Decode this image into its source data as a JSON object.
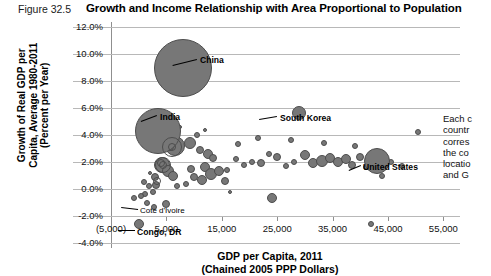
{
  "figure": {
    "number_label": "Figure 32.5",
    "title": "Growth and Income Relationship with Area Proportional to Population"
  },
  "axes": {
    "y_title_line1": "Growth of Real GDP per",
    "y_title_line2": "Capita, Average 1980-2011",
    "y_title_line3": "(Percent per Year)",
    "x_title_line1": "GDP per Capita, 2011",
    "x_title_line2": "(Chained 2005 PPP Dollars)",
    "y_ticks": [
      "12.0%",
      "10.0%",
      "8.0%",
      "6.0%",
      "4.0%",
      "2.0%",
      "0.0%",
      "-2.0%",
      "-4.0%"
    ],
    "x_ticks": [
      "(5,000)",
      "5,000",
      "15,000",
      "25,000",
      "35,000",
      "45,000",
      "55,000"
    ]
  },
  "side_note": {
    "line1": "Each c",
    "line2": "countr",
    "line3": "corres",
    "line4": "the co",
    "line5": "locatio",
    "line6": "and G"
  },
  "annotations": {
    "china": "China",
    "india": "India",
    "south_korea": "South Korea",
    "united_states": "United States",
    "cote_divoire": "Cote d'Ivoire",
    "congo_dr": "Congo, DR"
  },
  "colors": {
    "bubble_fill": "#777777",
    "bubble_stroke": "#4d4d4d",
    "grid": "#b8b8b8",
    "axis": "#8f8f8f",
    "text": "#000000"
  },
  "chart_data": {
    "type": "scatter",
    "title": "Growth and Income Relationship with Area Proportional to Population",
    "xlabel": "GDP per Capita, 2011 (Chained 2005 PPP Dollars)",
    "ylabel": "Growth of Real GDP per Capita, Average 1980-2011 (Percent per Year)",
    "xlim": [
      -5000,
      58000
    ],
    "ylim": [
      -4.0,
      12.0
    ],
    "xticks": [
      -5000,
      5000,
      15000,
      25000,
      35000,
      45000,
      55000
    ],
    "yticks": [
      -4.0,
      -2.0,
      0.0,
      2.0,
      4.0,
      6.0,
      8.0,
      10.0,
      12.0
    ],
    "grid": true,
    "legend": "none",
    "size_encoding": "bubble area proportional to population",
    "labeled_points": [
      {
        "name": "China",
        "x": 8000,
        "y": 9.0,
        "r": 29
      },
      {
        "name": "India",
        "x": 3500,
        "y": 4.3,
        "r": 23
      },
      {
        "name": "South Korea",
        "x": 29000,
        "y": 5.6,
        "r": 7
      },
      {
        "name": "United States",
        "x": 43000,
        "y": 2.1,
        "r": 13
      },
      {
        "name": "Cote d'Ivoire",
        "x": -800,
        "y": -0.7,
        "r": 3
      },
      {
        "name": "Congo, DR",
        "x": 0,
        "y": -2.6,
        "r": 5
      }
    ],
    "points": [
      {
        "x": 6500,
        "y": 3.2,
        "r": 10
      },
      {
        "x": 5600,
        "y": 3.1,
        "r": 4
      },
      {
        "x": 9200,
        "y": 3.4,
        "r": 6
      },
      {
        "x": 4200,
        "y": 1.8,
        "r": 8
      },
      {
        "x": 4100,
        "y": 1.9,
        "r": 4
      },
      {
        "x": 3000,
        "y": 0.9,
        "r": 4
      },
      {
        "x": 5300,
        "y": 1.3,
        "r": 6
      },
      {
        "x": 6200,
        "y": 1.0,
        "r": 5
      },
      {
        "x": 3100,
        "y": 0.3,
        "r": 4
      },
      {
        "x": 1800,
        "y": 0.2,
        "r": 3
      },
      {
        "x": 900,
        "y": 0.5,
        "r": 3
      },
      {
        "x": 2500,
        "y": -0.2,
        "r": 3
      },
      {
        "x": 1200,
        "y": -0.4,
        "r": 3
      },
      {
        "x": 400,
        "y": -0.5,
        "r": 3
      },
      {
        "x": 2000,
        "y": 1.2,
        "r": 2
      },
      {
        "x": 11000,
        "y": 2.9,
        "r": 4
      },
      {
        "x": 12500,
        "y": 2.6,
        "r": 5
      },
      {
        "x": 13500,
        "y": 2.3,
        "r": 4
      },
      {
        "x": 12000,
        "y": 1.6,
        "r": 5
      },
      {
        "x": 13000,
        "y": 1.1,
        "r": 6
      },
      {
        "x": 14500,
        "y": 1.3,
        "r": 5
      },
      {
        "x": 11500,
        "y": 0.7,
        "r": 5
      },
      {
        "x": 10000,
        "y": 0.9,
        "r": 4
      },
      {
        "x": 9500,
        "y": 1.5,
        "r": 4
      },
      {
        "x": 15500,
        "y": 0.6,
        "r": 4
      },
      {
        "x": 16000,
        "y": 1.4,
        "r": 3
      },
      {
        "x": 17500,
        "y": 2.2,
        "r": 3
      },
      {
        "x": 19000,
        "y": 1.8,
        "r": 3
      },
      {
        "x": 20500,
        "y": 2.0,
        "r": 3
      },
      {
        "x": 22000,
        "y": 1.9,
        "r": 4
      },
      {
        "x": 23500,
        "y": 2.6,
        "r": 3
      },
      {
        "x": 25000,
        "y": 2.4,
        "r": 4
      },
      {
        "x": 26500,
        "y": 1.7,
        "r": 3
      },
      {
        "x": 28000,
        "y": 2.0,
        "r": 3
      },
      {
        "x": 30000,
        "y": 2.5,
        "r": 5
      },
      {
        "x": 31500,
        "y": 1.9,
        "r": 5
      },
      {
        "x": 33000,
        "y": 2.1,
        "r": 6
      },
      {
        "x": 34500,
        "y": 2.3,
        "r": 5
      },
      {
        "x": 36000,
        "y": 2.0,
        "r": 5
      },
      {
        "x": 37500,
        "y": 2.2,
        "r": 5
      },
      {
        "x": 38500,
        "y": 1.8,
        "r": 4
      },
      {
        "x": 40000,
        "y": 2.4,
        "r": 4
      },
      {
        "x": 41000,
        "y": 1.6,
        "r": 3
      },
      {
        "x": 45500,
        "y": 2.0,
        "r": 3
      },
      {
        "x": 47500,
        "y": 1.7,
        "r": 3
      },
      {
        "x": 50500,
        "y": 4.2,
        "r": 3
      },
      {
        "x": 44000,
        "y": 1.0,
        "r": 3
      },
      {
        "x": 39000,
        "y": 3.2,
        "r": 3
      },
      {
        "x": 33500,
        "y": 3.4,
        "r": 3
      },
      {
        "x": 27500,
        "y": 3.6,
        "r": 3
      },
      {
        "x": 21500,
        "y": 3.8,
        "r": 3
      },
      {
        "x": 18000,
        "y": 3.3,
        "r": 3
      },
      {
        "x": 24000,
        "y": -0.7,
        "r": 5
      },
      {
        "x": 42000,
        "y": -2.6,
        "r": 3
      },
      {
        "x": 5000,
        "y": -1.1,
        "r": 4
      },
      {
        "x": 1500,
        "y": -1.0,
        "r": 3
      },
      {
        "x": 2800,
        "y": -1.3,
        "r": 3
      },
      {
        "x": 7000,
        "y": 0.2,
        "r": 3
      },
      {
        "x": 8500,
        "y": 0.4,
        "r": 3
      },
      {
        "x": 16500,
        "y": -0.2,
        "r": 2
      },
      {
        "x": 10500,
        "y": 4.0,
        "r": 3
      },
      {
        "x": 12000,
        "y": 4.4,
        "r": 2
      },
      {
        "x": 7500,
        "y": 4.6,
        "r": 2
      }
    ],
    "rings": [
      {
        "x": 6000,
        "y": 3.1,
        "r": 10
      },
      {
        "x": 6100,
        "y": 3.1,
        "r": 4
      },
      {
        "x": 4300,
        "y": 1.8,
        "r": 8
      },
      {
        "x": 4300,
        "y": 1.8,
        "r": 4
      },
      {
        "x": 3300,
        "y": 0.6,
        "r": 4
      }
    ]
  }
}
